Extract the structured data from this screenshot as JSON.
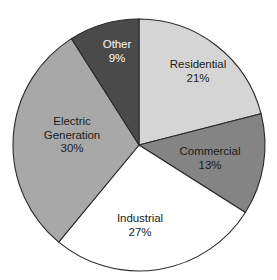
{
  "chart_data": {
    "type": "pie",
    "title": "",
    "xlabel": "",
    "ylabel": "",
    "legend_position": "none",
    "grid": false,
    "start_angle_deg": 0,
    "direction": "clockwise",
    "categories": [
      "Residential",
      "Commercial",
      "Industrial",
      "Electric Generation",
      "Other"
    ],
    "values": [
      21,
      13,
      27,
      30,
      9
    ],
    "units": "percent",
    "slices": [
      {
        "label": "Residential",
        "value": 21,
        "value_text": "21%",
        "color": "#d5d5d5",
        "label_lines": [
          "Residential",
          "21%"
        ]
      },
      {
        "label": "Commercial",
        "value": 13,
        "value_text": "13%",
        "color": "#848484",
        "label_lines": [
          "Commercial",
          "13%"
        ]
      },
      {
        "label": "Industrial",
        "value": 27,
        "value_text": "27%",
        "color": "#ffffff",
        "label_lines": [
          "Industrial",
          "27%"
        ]
      },
      {
        "label": "Electric Generation",
        "value": 30,
        "value_text": "30%",
        "color": "#a8a8a8",
        "label_lines": [
          "Electric",
          "Generation",
          "30%"
        ]
      },
      {
        "label": "Other",
        "value": 9,
        "value_text": "9%",
        "color": "#4a4a4a",
        "label_lines": [
          "Other",
          "9%"
        ]
      }
    ]
  },
  "labels": {
    "residential": {
      "name": "Residential",
      "value": "21%"
    },
    "commercial": {
      "name": "Commercial",
      "value": "13%"
    },
    "industrial": {
      "name": "Industrial",
      "value": "27%"
    },
    "electric": {
      "name": "Electric",
      "name2": "Generation",
      "value": "30%"
    },
    "other": {
      "name": "Other",
      "value": "9%"
    }
  },
  "geometry": {
    "center_x": 139,
    "center_y": 145,
    "radius": 126
  },
  "colors": {
    "outline": "#2b2b2b",
    "background": "#ffffff",
    "residential": "#d5d5d5",
    "commercial": "#848484",
    "industrial": "#ffffff",
    "electric": "#a8a8a8",
    "other": "#4a4a4a",
    "label_text": "#1c1c1c",
    "label_text_light": "#fafafa"
  }
}
